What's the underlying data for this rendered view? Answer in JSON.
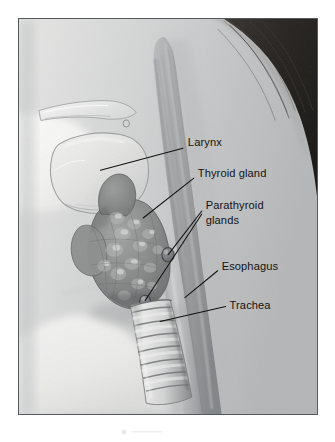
{
  "figure": {
    "type": "medical-illustration",
    "style": "grayscale pencil/airbrush rendering",
    "frame_border_color": "#55595c",
    "page_background": "#ffffff",
    "skin_tone": "#d2d3d3",
    "hair_color": "#2a2724",
    "gland_color": "#8b8c8c",
    "ink_color": "#121212"
  },
  "labels": [
    {
      "id": "larynx",
      "text": "Larynx",
      "text_x": 170,
      "text_y": 124,
      "leader": "M 82,152 L 165,130"
    },
    {
      "id": "thyroid-gland",
      "text": "Thyroid gland",
      "text_x": 180,
      "text_y": 155,
      "leader": "M 125,200 L 176,160"
    },
    {
      "id": "parathyroid-glands",
      "text_line_1": "Parathyroid",
      "text_line_2": "glands",
      "text_x": 188,
      "text_y": 187,
      "leader_upper": "M 150,237 L 184,193",
      "leader_lower": "M 127,283 L 184,196"
    },
    {
      "id": "esophagus",
      "text": "Esophagus",
      "text_x": 204,
      "text_y": 248,
      "leader": "M 167,280 L 200,253"
    },
    {
      "id": "trachea",
      "text": "Trachea",
      "text_x": 212,
      "text_y": 287,
      "leader": "M 142,304 L 208,289"
    }
  ],
  "structures": [
    {
      "id": "neck-skin",
      "name": "neck and shoulder profile"
    },
    {
      "id": "hair",
      "name": "hair"
    },
    {
      "id": "hyoid-bone",
      "name": "hyoid bone"
    },
    {
      "id": "larynx-cartilage",
      "name": "laryngeal cartilage"
    },
    {
      "id": "thyroid-gland-body",
      "name": "thyroid gland lobes"
    },
    {
      "id": "parathyroid-gland-upper",
      "name": "superior parathyroid gland"
    },
    {
      "id": "parathyroid-gland-lower",
      "name": "inferior parathyroid gland"
    },
    {
      "id": "trachea-rings",
      "name": "tracheal cartilage rings"
    },
    {
      "id": "esophagus-tube",
      "name": "esophagus"
    }
  ]
}
